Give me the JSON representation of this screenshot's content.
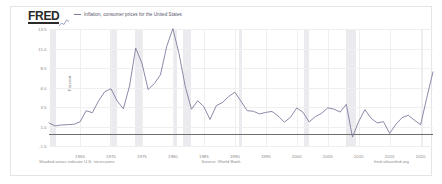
{
  "header": {
    "logo_text": "FRED",
    "logo_mark": "line-graph-icon",
    "legend_label": "Inflation, consumer prices for the United States",
    "legend_color": "#7d7d9e"
  },
  "footer": {
    "left_note": "Shaded areas indicate U.S. recessions",
    "source": "Source: World Bank",
    "attribution": "fred.stlouisfed.org"
  },
  "chart_data": {
    "type": "line",
    "title": "Inflation, consumer prices for the United States",
    "xlabel": "",
    "ylabel": "Percent",
    "ylim": [
      -1.5,
      13.5
    ],
    "xlim": [
      1960,
      2022
    ],
    "grid": true,
    "legend_position": "top-left",
    "line_color": "#7d7d9e",
    "zero_line": 0,
    "yticks": [
      13.5,
      11.0,
      8.5,
      6.0,
      3.5,
      1.0,
      -1.5
    ],
    "ytick_labels": [
      "13.5",
      "11.0",
      "8.5",
      "6.0",
      "3.5",
      "1.0",
      "-1.5"
    ],
    "xticks": [
      1965,
      1970,
      1975,
      1980,
      1985,
      1990,
      1995,
      2000,
      2005,
      2010,
      2015,
      2020
    ],
    "xtick_labels": [
      "1965",
      "1970",
      "1975",
      "1980",
      "1985",
      "1990",
      "1995",
      "2000",
      "2005",
      "2010",
      "2015",
      "2020"
    ],
    "recessions": [
      {
        "start": 1960.2,
        "end": 1961.2
      },
      {
        "start": 1969.9,
        "end": 1970.9
      },
      {
        "start": 1973.9,
        "end": 1975.2
      },
      {
        "start": 1980.0,
        "end": 1980.6
      },
      {
        "start": 1981.6,
        "end": 1982.9
      },
      {
        "start": 1990.6,
        "end": 1991.2
      },
      {
        "start": 2001.2,
        "end": 2001.9
      },
      {
        "start": 2007.9,
        "end": 2009.5
      },
      {
        "start": 2020.1,
        "end": 2020.4
      }
    ],
    "series": [
      {
        "name": "Inflation, consumer prices for the United States",
        "x": [
          1960,
          1961,
          1962,
          1963,
          1964,
          1965,
          1966,
          1967,
          1968,
          1969,
          1970,
          1971,
          1972,
          1973,
          1974,
          1975,
          1976,
          1977,
          1978,
          1979,
          1980,
          1981,
          1982,
          1983,
          1984,
          1985,
          1986,
          1987,
          1988,
          1989,
          1990,
          1991,
          1992,
          1993,
          1994,
          1995,
          1996,
          1997,
          1998,
          1999,
          2000,
          2001,
          2002,
          2003,
          2004,
          2005,
          2006,
          2007,
          2008,
          2009,
          2010,
          2011,
          2012,
          2013,
          2014,
          2015,
          2016,
          2017,
          2018,
          2019,
          2020,
          2021,
          2022
        ],
        "values": [
          1.46,
          1.07,
          1.2,
          1.24,
          1.28,
          1.59,
          3.02,
          2.77,
          4.27,
          5.46,
          5.84,
          4.29,
          3.27,
          6.18,
          11.05,
          9.14,
          5.74,
          6.5,
          7.63,
          11.25,
          13.55,
          10.33,
          6.13,
          3.21,
          4.3,
          3.55,
          1.9,
          3.66,
          4.08,
          4.83,
          5.4,
          4.23,
          3.03,
          2.95,
          2.61,
          2.81,
          2.93,
          2.34,
          1.55,
          2.19,
          3.38,
          2.83,
          1.59,
          2.27,
          2.68,
          3.39,
          3.23,
          2.85,
          3.84,
          -0.36,
          1.64,
          3.16,
          2.07,
          1.46,
          1.62,
          0.12,
          1.26,
          2.13,
          2.44,
          1.81,
          1.23,
          4.7,
          8.0
        ]
      }
    ]
  }
}
